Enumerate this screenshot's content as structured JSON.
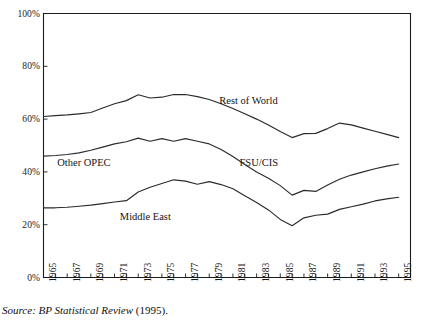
{
  "figure": {
    "source_note": {
      "italic_part": "Source: BP Statistical Review",
      "roman_part": " (1995)."
    }
  },
  "chart_data": {
    "type": "line",
    "title": "",
    "xlabel": "",
    "ylabel": "",
    "xlim": [
      1965,
      1996
    ],
    "ylim": [
      0,
      100
    ],
    "grid": false,
    "legend_position": "inline-annotations",
    "y_tick_labels": [
      "0%",
      "20%",
      "40%",
      "60%",
      "80%",
      "100%"
    ],
    "y_tick_values": [
      0,
      20,
      40,
      60,
      80,
      100
    ],
    "x_tick_labels": [
      "1965",
      "1967",
      "1969",
      "1971",
      "1973",
      "1975",
      "1977",
      "1979",
      "1981",
      "1983",
      "1985",
      "1987",
      "1989",
      "1991",
      "1993",
      "1995"
    ],
    "x_tick_values": [
      1965,
      1967,
      1969,
      1971,
      1973,
      1975,
      1977,
      1979,
      1981,
      1983,
      1985,
      1987,
      1989,
      1991,
      1993,
      1995
    ],
    "x": [
      1965,
      1966,
      1967,
      1968,
      1969,
      1970,
      1971,
      1972,
      1973,
      1974,
      1975,
      1976,
      1977,
      1978,
      1979,
      1980,
      1981,
      1982,
      1983,
      1984,
      1985,
      1986,
      1987,
      1988,
      1989,
      1990,
      1991,
      1992,
      1993,
      1994,
      1995
    ],
    "series": [
      {
        "name": "Rest of World",
        "values": [
          61.0,
          61.3,
          61.6,
          62.0,
          62.5,
          64.2,
          65.8,
          67.0,
          69.2,
          68.0,
          68.3,
          69.3,
          69.3,
          68.5,
          67.4,
          65.8,
          64.0,
          62.0,
          60.0,
          57.8,
          55.3,
          53.0,
          54.5,
          54.6,
          56.4,
          58.5,
          57.8,
          56.6,
          55.4,
          54.2,
          53.0
        ]
      },
      {
        "name": "FSU/CIS",
        "values": [
          46.0,
          46.2,
          46.6,
          47.2,
          48.2,
          49.4,
          50.6,
          51.4,
          52.8,
          51.6,
          52.6,
          51.6,
          52.6,
          51.6,
          50.6,
          48.5,
          45.8,
          42.8,
          40.0,
          37.6,
          34.8,
          31.2,
          33.0,
          32.6,
          35.0,
          37.2,
          38.8,
          40.0,
          41.2,
          42.2,
          43.0
        ]
      },
      {
        "name": "Middle East",
        "values": [
          26.4,
          26.4,
          26.6,
          27.0,
          27.4,
          28.0,
          28.6,
          29.1,
          32.4,
          34.2,
          35.6,
          37.0,
          36.5,
          35.3,
          36.3,
          35.2,
          33.6,
          31.0,
          28.4,
          25.6,
          22.0,
          19.6,
          22.6,
          23.6,
          24.0,
          25.8,
          26.8,
          27.8,
          29.0,
          29.8,
          30.4
        ]
      }
    ],
    "annotations": [
      {
        "text": "Rest of World",
        "x": 1982.3,
        "y": 67.0
      },
      {
        "text": "Other OPEC",
        "x": 1968.4,
        "y": 43.5
      },
      {
        "text": "FSU/CIS",
        "x": 1983.2,
        "y": 43.2
      },
      {
        "text": "Middle East",
        "x": 1973.6,
        "y": 23.0
      }
    ]
  }
}
